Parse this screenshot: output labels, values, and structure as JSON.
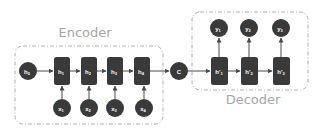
{
  "diagram": {
    "colors": {
      "node_fill": "#3a3a3a",
      "node_text": "#ffffff",
      "edge": "#4a4a4a",
      "group_border": "#9a9a9a",
      "group_label": "#a6a6a6",
      "background": "#ffffff"
    },
    "groups": {
      "encoder": {
        "label": "Encoder"
      },
      "decoder": {
        "label": "Decoder"
      }
    },
    "encoder": {
      "initial_state": {
        "label": "h",
        "sub": "0"
      },
      "hidden": [
        {
          "label": "h",
          "sub": "1"
        },
        {
          "label": "h",
          "sub": "2"
        },
        {
          "label": "h",
          "sub": "3"
        },
        {
          "label": "h",
          "sub": "4"
        }
      ],
      "inputs": [
        {
          "label": "x",
          "sub": "1"
        },
        {
          "label": "x",
          "sub": "2"
        },
        {
          "label": "x",
          "sub": "3"
        },
        {
          "label": "x",
          "sub": "4"
        }
      ]
    },
    "context": {
      "label": "C"
    },
    "decoder": {
      "hidden": [
        {
          "label": "h'",
          "sub": "1"
        },
        {
          "label": "h'",
          "sub": "2"
        },
        {
          "label": "h'",
          "sub": "3"
        }
      ],
      "outputs": [
        {
          "label": "y",
          "sub": "1"
        },
        {
          "label": "y",
          "sub": "2"
        },
        {
          "label": "y",
          "sub": "3"
        }
      ]
    }
  }
}
